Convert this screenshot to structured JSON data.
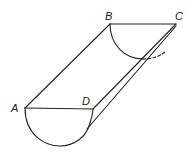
{
  "figure": {
    "stroke_color": "#222222",
    "background": "#ffffff",
    "labels": {
      "A": "A",
      "B": "B",
      "C": "C",
      "D": "D"
    },
    "points": {
      "A": [
        25,
        108
      ],
      "B": [
        110,
        24
      ],
      "C": [
        176,
        24
      ],
      "D": [
        93,
        109
      ]
    }
  }
}
